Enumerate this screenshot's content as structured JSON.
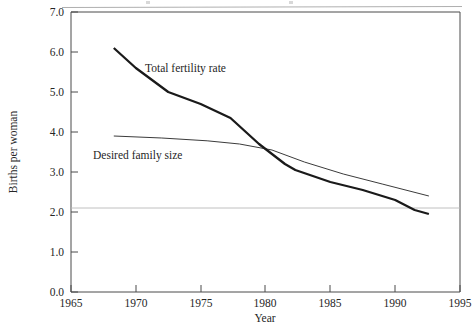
{
  "chart_data": {
    "type": "line",
    "title": "",
    "xlabel": "Year",
    "ylabel": "Births per woman",
    "xlim": [
      1965,
      1995
    ],
    "ylim": [
      0.0,
      7.0
    ],
    "grid": false,
    "legend_position": "inline-annotations",
    "xticks": [
      1965,
      1970,
      1975,
      1980,
      1985,
      1990,
      1995
    ],
    "xtick_labels": [
      "1965",
      "1970",
      "1975",
      "1980",
      "1985",
      "1990",
      "1995"
    ],
    "yticks": [
      0.0,
      1.0,
      2.0,
      3.0,
      4.0,
      5.0,
      6.0,
      7.0
    ],
    "ytick_labels": [
      "0.0",
      "1.0",
      "2.0",
      "3.0",
      "4.0",
      "5.0",
      "6.0",
      "7.0"
    ],
    "series": [
      {
        "name": "Total fertility rate",
        "label_text": "Total fertility rate",
        "x": [
          1968.3,
          1970.0,
          1972.5,
          1975.0,
          1977.3,
          1979.5,
          1981.5,
          1982.3,
          1985.0,
          1987.5,
          1990.0,
          1991.5,
          1992.6
        ],
        "values": [
          6.1,
          5.6,
          5.0,
          4.7,
          4.35,
          3.7,
          3.2,
          3.05,
          2.75,
          2.55,
          2.3,
          2.05,
          1.95
        ]
      },
      {
        "name": "Desired family size",
        "label_text": "Desired family size",
        "x": [
          1968.3,
          1972.0,
          1975.5,
          1978.0,
          1980.5,
          1983.0,
          1986.0,
          1989.0,
          1992.6
        ],
        "values": [
          3.9,
          3.85,
          3.78,
          3.7,
          3.55,
          3.25,
          2.95,
          2.7,
          2.4
        ]
      }
    ],
    "reference_lines": [
      {
        "name": "replacement-level",
        "orientation": "horizontal",
        "value": 2.1
      }
    ]
  },
  "annotations": {
    "tfr_label": "Total fertility rate",
    "desired_label": "Desired family size"
  },
  "axes": {
    "y_axis_title": "Births per woman",
    "x_axis_title": "Year"
  }
}
